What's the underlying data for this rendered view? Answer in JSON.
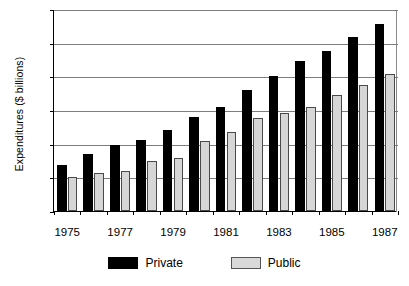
{
  "chart_data": {
    "type": "bar",
    "title": "",
    "xlabel": "",
    "ylabel": "Expenditures ($ billions)",
    "categories": [
      "1975",
      "1976",
      "1977",
      "1978",
      "1979",
      "1980",
      "1981",
      "1982",
      "1983",
      "1984",
      "1985",
      "1986",
      "1987"
    ],
    "tick_labels_shown": [
      "1975",
      "1977",
      "1979",
      "1981",
      "1983",
      "1985",
      "1987"
    ],
    "series": [
      {
        "name": "Private",
        "color": "#000000",
        "values": [
          68,
          85,
          98,
          105,
          120,
          140,
          155,
          180,
          200,
          223,
          238,
          259,
          278
        ]
      },
      {
        "name": "Public",
        "color": "#d6d6d6",
        "values": [
          50,
          56,
          59,
          75,
          79,
          104,
          118,
          138,
          146,
          154,
          173,
          187,
          203
        ]
      }
    ],
    "ylim": [
      0,
      300
    ],
    "yticks": [
      0,
      50,
      100,
      150,
      200,
      250,
      300
    ],
    "ytick_labels": [
      "0",
      "50",
      "100",
      "150",
      "200",
      "250",
      "300"
    ],
    "grid": true,
    "legend_position": "bottom-center"
  },
  "legend": {
    "items": [
      {
        "label": "Private",
        "color": "#000000"
      },
      {
        "label": "Public",
        "color": "#d6d6d6"
      }
    ]
  }
}
